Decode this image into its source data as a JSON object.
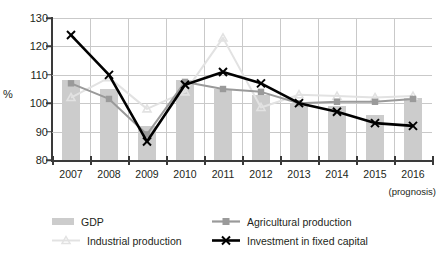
{
  "chart_data": {
    "type": "bar",
    "title": "",
    "xlabel": "",
    "ylabel": "%",
    "ylim": [
      80,
      130
    ],
    "yticks": [
      80,
      90,
      100,
      110,
      120,
      130
    ],
    "grid": true,
    "legend_position": "bottom",
    "categories": [
      "2007",
      "2008",
      "2009",
      "2010",
      "2011",
      "2012",
      "2013",
      "2014",
      "2015",
      "2016"
    ],
    "x_axis_note": "(prognosis)",
    "series": [
      {
        "name": "GDP",
        "type": "bar",
        "color": "#cccccc",
        "marker": "none",
        "values": [
          108,
          105,
          92,
          108,
          105,
          103,
          100,
          99,
          96,
          102
        ]
      },
      {
        "name": "Agricultural production",
        "type": "line",
        "color": "#9a9a9a",
        "marker": "square",
        "values": [
          107,
          101.5,
          89,
          107.5,
          105,
          104,
          100,
          100.5,
          100.5,
          101.5
        ]
      },
      {
        "name": "Industrial production",
        "type": "line",
        "color": "#e2e2e2",
        "marker": "triangle",
        "values": [
          102,
          109,
          98,
          104,
          123,
          98.5,
          103,
          102.5,
          102,
          102.5
        ]
      },
      {
        "name": "Investment in fixed capital",
        "type": "line",
        "color": "#000000",
        "marker": "x",
        "values": [
          124,
          110,
          86.5,
          106.5,
          111,
          107,
          100,
          97,
          93,
          92
        ]
      }
    ]
  },
  "axis": {
    "y_label": "%",
    "y_ticks": [
      "130",
      "120",
      "110",
      "100",
      "90",
      "80"
    ],
    "x_ticks": [
      "2007",
      "2008",
      "2009",
      "2010",
      "2011",
      "2012",
      "2013",
      "2014",
      "2015",
      "2016"
    ],
    "prognosis_note": "(prognosis)"
  },
  "legend": {
    "gdp": "GDP",
    "agricultural": "Agricultural production",
    "industrial": "Industrial production",
    "investment": "Investment in fixed capital"
  }
}
